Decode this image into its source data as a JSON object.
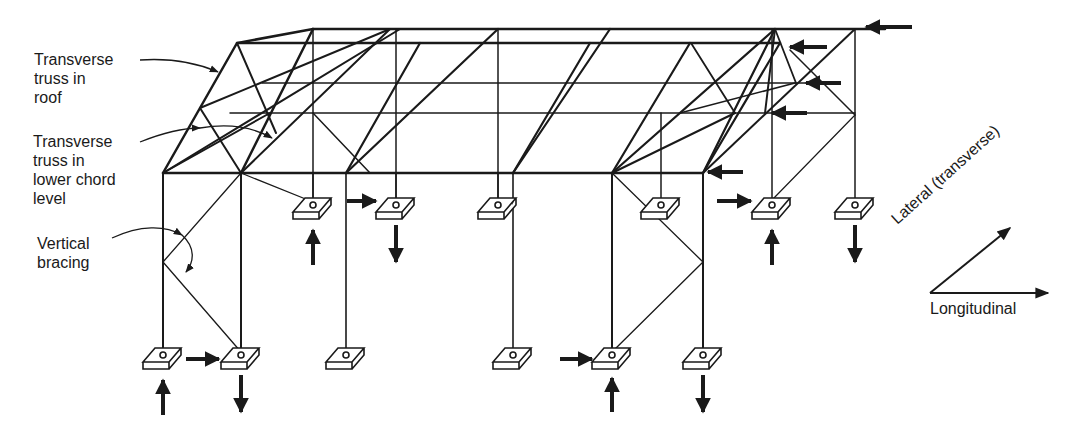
{
  "labels": {
    "roof_truss": "Transverse truss in roof",
    "roof_truss_lines": [
      "Transverse",
      "truss in",
      "roof"
    ],
    "lower_truss_lines": [
      "Transverse",
      "truss in",
      "lower chord",
      "level"
    ],
    "vertical_lines": [
      "Vertical",
      "bracing"
    ]
  },
  "axes": {
    "lateral": "Lateral (transverse)",
    "longitudinal": "Longitudinal"
  },
  "colors": {
    "ink": "#1a1a1a",
    "background": "#ffffff"
  }
}
